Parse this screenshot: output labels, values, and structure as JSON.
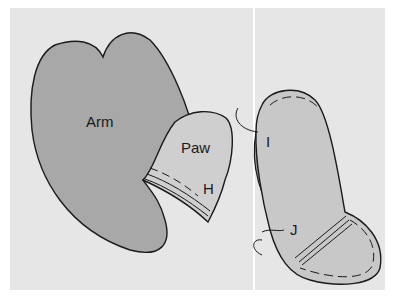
{
  "diagram": {
    "panels": [
      {
        "id": "left",
        "parts": [
          {
            "name": "arm",
            "label": "Arm"
          },
          {
            "name": "paw",
            "label": "Paw"
          },
          {
            "name": "seam-h",
            "label": "H"
          }
        ]
      },
      {
        "id": "right",
        "parts": [
          {
            "name": "seam-i",
            "label": "I"
          },
          {
            "name": "seam-j",
            "label": "J"
          }
        ]
      }
    ],
    "colors": {
      "background": "#e6e6e6",
      "arm_fill": "#a8a8a8",
      "paw_fill": "#cfcfcf",
      "outline": "#1a1a1a",
      "piece_fill": "#c8c8c8",
      "inner_fold": "#9c9c9c"
    }
  }
}
